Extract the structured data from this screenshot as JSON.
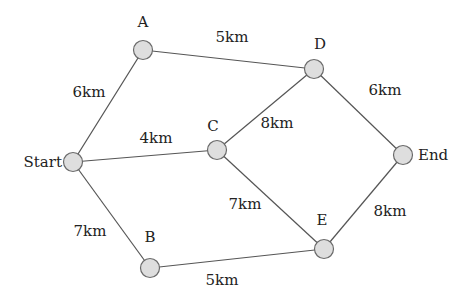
{
  "diagram": {
    "type": "weighted-graph",
    "node_color": "#dedede",
    "edge_color": "#555555",
    "nodes": [
      {
        "id": "A",
        "label": "A",
        "x": 143,
        "y": 50,
        "lx": 143,
        "ly": 27,
        "anchor": "middle"
      },
      {
        "id": "D",
        "label": "D",
        "x": 314,
        "y": 69,
        "lx": 320,
        "ly": 49,
        "anchor": "middle"
      },
      {
        "id": "Start",
        "label": "Start",
        "x": 73,
        "y": 162,
        "lx": 62,
        "ly": 167,
        "anchor": "end"
      },
      {
        "id": "C",
        "label": "C",
        "x": 217,
        "y": 150,
        "lx": 213,
        "ly": 131,
        "anchor": "middle"
      },
      {
        "id": "End",
        "label": "End",
        "x": 403,
        "y": 155,
        "lx": 418,
        "ly": 160,
        "anchor": "start"
      },
      {
        "id": "B",
        "label": "B",
        "x": 150,
        "y": 268,
        "lx": 150,
        "ly": 242,
        "anchor": "middle"
      },
      {
        "id": "E",
        "label": "E",
        "x": 324,
        "y": 249,
        "lx": 322,
        "ly": 225,
        "anchor": "middle"
      }
    ],
    "edges": [
      {
        "from": "A",
        "to": "D",
        "label": "5km",
        "lx": 232,
        "ly": 42
      },
      {
        "from": "Start",
        "to": "A",
        "label": "6km",
        "lx": 89,
        "ly": 97
      },
      {
        "from": "Start",
        "to": "C",
        "label": "4km",
        "lx": 156,
        "ly": 143
      },
      {
        "from": "C",
        "to": "D",
        "label": "8km",
        "lx": 277,
        "ly": 128
      },
      {
        "from": "D",
        "to": "End",
        "label": "6km",
        "lx": 385,
        "ly": 95
      },
      {
        "from": "C",
        "to": "E",
        "label": "7km",
        "lx": 245,
        "ly": 209
      },
      {
        "from": "Start",
        "to": "B",
        "label": "7km",
        "lx": 90,
        "ly": 236
      },
      {
        "from": "B",
        "to": "E",
        "label": "5km",
        "lx": 222,
        "ly": 285
      },
      {
        "from": "E",
        "to": "End",
        "label": "8km",
        "lx": 390,
        "ly": 216
      }
    ]
  }
}
